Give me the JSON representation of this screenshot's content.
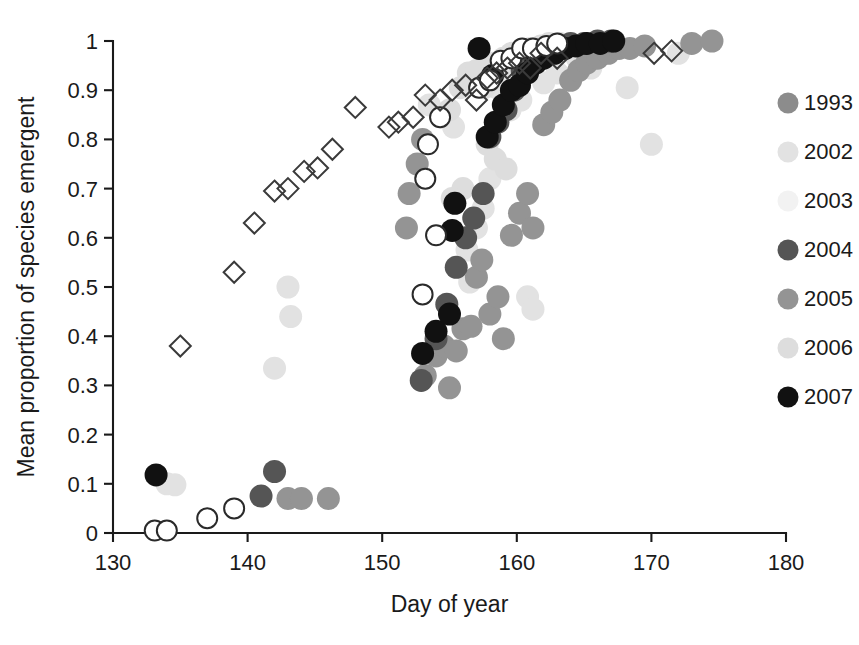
{
  "figure": {
    "type": "scatter-plot",
    "background": "#ffffff"
  },
  "axes": {
    "x_title": "Day of year",
    "y_title": "Mean proportion of species emergent",
    "x_ticks": [
      "130",
      "140",
      "150",
      "160",
      "170",
      "180"
    ],
    "y_ticks": [
      "0",
      "0.1",
      "0.2",
      "0.3",
      "0.4",
      "0.5",
      "0.6",
      "0.7",
      "0.8",
      "0.9",
      "1"
    ]
  },
  "legend": {
    "items": [
      {
        "label": "1993",
        "marker": "circle",
        "color": "#8c8c8c"
      },
      {
        "label": "2002",
        "marker": "circle",
        "color": "#e2e2e2"
      },
      {
        "label": "2003",
        "marker": "circle",
        "color": "#f2f2f2"
      },
      {
        "label": "2004",
        "marker": "circle",
        "color": "#555555"
      },
      {
        "label": "2005",
        "marker": "circle",
        "color": "#949494"
      },
      {
        "label": "2006",
        "marker": "circle",
        "color": "#dddddd"
      },
      {
        "label": "2007",
        "marker": "circle",
        "color": "#111111"
      }
    ]
  },
  "chart_data": {
    "type": "scatter",
    "title": "",
    "xlabel": "Day of year",
    "ylabel": "Mean proportion of species emergent",
    "xlim": [
      130,
      180
    ],
    "ylim": [
      0,
      1
    ],
    "xticks": [
      130,
      140,
      150,
      160,
      170,
      180
    ],
    "yticks": [
      0,
      0.1,
      0.2,
      0.3,
      0.4,
      0.5,
      0.6,
      0.7,
      0.8,
      0.9,
      1.0
    ],
    "grid": false,
    "legend_position": "right",
    "series": [
      {
        "name": "1993",
        "marker": "open-diamond",
        "color": "#3a3a3a",
        "fill": "none",
        "points": [
          [
            135.0,
            0.38
          ],
          [
            139.0,
            0.53
          ],
          [
            140.5,
            0.63
          ],
          [
            142.0,
            0.695
          ],
          [
            143.0,
            0.7
          ],
          [
            144.2,
            0.735
          ],
          [
            145.2,
            0.742
          ],
          [
            146.3,
            0.78
          ],
          [
            148.0,
            0.865
          ],
          [
            150.5,
            0.825
          ],
          [
            151.2,
            0.835
          ],
          [
            152.3,
            0.845
          ],
          [
            153.2,
            0.89
          ],
          [
            154.3,
            0.88
          ],
          [
            155.2,
            0.9
          ],
          [
            156.2,
            0.91
          ],
          [
            157.0,
            0.88
          ],
          [
            157.8,
            0.925
          ],
          [
            158.5,
            0.935
          ],
          [
            159.3,
            0.945
          ],
          [
            160.2,
            0.955
          ],
          [
            161.0,
            0.945
          ],
          [
            161.8,
            0.975
          ],
          [
            163.0,
            0.965
          ],
          [
            170.2,
            0.975
          ],
          [
            171.5,
            0.98
          ]
        ]
      },
      {
        "name": "2002",
        "marker": "circle",
        "color": "#e2e2e2",
        "points": [
          [
            134.0,
            0.1
          ],
          [
            134.6,
            0.098
          ],
          [
            142.0,
            0.335
          ],
          [
            143.2,
            0.44
          ],
          [
            143.0,
            0.5
          ],
          [
            153.5,
            0.87
          ],
          [
            154.5,
            0.845
          ],
          [
            155.3,
            0.825
          ],
          [
            156.3,
            0.575
          ],
          [
            156.5,
            0.51
          ],
          [
            157.0,
            0.62
          ],
          [
            157.5,
            0.66
          ],
          [
            158.0,
            0.72
          ],
          [
            158.5,
            0.905
          ],
          [
            159.0,
            0.93
          ],
          [
            159.5,
            0.86
          ],
          [
            160.3,
            0.88
          ],
          [
            160.8,
            0.48
          ],
          [
            161.2,
            0.455
          ],
          [
            162.0,
            0.915
          ],
          [
            163.0,
            0.935
          ],
          [
            164.5,
            0.965
          ],
          [
            165.5,
            0.945
          ],
          [
            168.2,
            0.905
          ],
          [
            170.0,
            0.79
          ],
          [
            172.0,
            0.975
          ]
        ]
      },
      {
        "name": "2003",
        "marker": "open-circle",
        "color": "#2a2a2a",
        "fill": "#ffffff",
        "points": [
          [
            133.1,
            0.005
          ],
          [
            134.0,
            0.005
          ],
          [
            137.0,
            0.03
          ],
          [
            139.0,
            0.05
          ],
          [
            153.0,
            0.485
          ],
          [
            154.0,
            0.605
          ],
          [
            153.2,
            0.72
          ],
          [
            153.4,
            0.79
          ],
          [
            154.3,
            0.845
          ],
          [
            157.2,
            0.905
          ],
          [
            158.0,
            0.92
          ],
          [
            158.8,
            0.96
          ],
          [
            159.6,
            0.965
          ],
          [
            160.4,
            0.985
          ],
          [
            161.2,
            0.985
          ],
          [
            162.2,
            0.99
          ],
          [
            163.0,
            0.995
          ]
        ]
      },
      {
        "name": "2004",
        "marker": "circle",
        "color": "#555555",
        "points": [
          [
            141.0,
            0.075
          ],
          [
            142.0,
            0.125
          ],
          [
            152.9,
            0.31
          ],
          [
            154.0,
            0.395
          ],
          [
            154.8,
            0.465
          ],
          [
            155.5,
            0.54
          ],
          [
            156.2,
            0.6
          ],
          [
            156.8,
            0.64
          ],
          [
            157.5,
            0.69
          ],
          [
            158.0,
            0.805
          ],
          [
            158.6,
            0.835
          ],
          [
            159.2,
            0.86
          ],
          [
            159.8,
            0.9
          ],
          [
            160.4,
            0.94
          ],
          [
            161.0,
            0.96
          ],
          [
            161.6,
            0.975
          ],
          [
            162.2,
            0.985
          ],
          [
            163.0,
            0.99
          ],
          [
            164.0,
            0.995
          ],
          [
            165.0,
            0.995
          ],
          [
            166.0,
            1.0
          ],
          [
            167.0,
            1.0
          ]
        ]
      },
      {
        "name": "2005",
        "marker": "circle",
        "color": "#949494",
        "points": [
          [
            143.0,
            0.07
          ],
          [
            144.0,
            0.07
          ],
          [
            146.0,
            0.07
          ],
          [
            151.8,
            0.62
          ],
          [
            152.0,
            0.69
          ],
          [
            152.6,
            0.75
          ],
          [
            153.0,
            0.8
          ],
          [
            153.2,
            0.32
          ],
          [
            154.0,
            0.36
          ],
          [
            154.6,
            0.38
          ],
          [
            155.0,
            0.295
          ],
          [
            155.5,
            0.37
          ],
          [
            156.0,
            0.415
          ],
          [
            156.6,
            0.42
          ],
          [
            157.0,
            0.52
          ],
          [
            157.4,
            0.555
          ],
          [
            158.0,
            0.445
          ],
          [
            158.6,
            0.48
          ],
          [
            159.0,
            0.395
          ],
          [
            159.6,
            0.605
          ],
          [
            160.2,
            0.65
          ],
          [
            160.8,
            0.69
          ],
          [
            161.2,
            0.62
          ],
          [
            162.0,
            0.83
          ],
          [
            162.6,
            0.855
          ],
          [
            163.2,
            0.88
          ],
          [
            164.0,
            0.92
          ],
          [
            164.6,
            0.94
          ],
          [
            165.2,
            0.955
          ],
          [
            166.0,
            0.965
          ],
          [
            166.8,
            0.975
          ],
          [
            167.6,
            0.985
          ],
          [
            168.4,
            0.985
          ],
          [
            169.5,
            0.99
          ],
          [
            173.0,
            0.995
          ],
          [
            174.5,
            1.0
          ]
        ]
      },
      {
        "name": "2006",
        "marker": "circle",
        "color": "#dddddd",
        "points": [
          [
            155.0,
            0.86
          ],
          [
            155.8,
            0.905
          ],
          [
            156.4,
            0.935
          ],
          [
            157.0,
            0.94
          ],
          [
            157.6,
            0.905
          ],
          [
            158.2,
            0.955
          ],
          [
            159.0,
            0.965
          ],
          [
            159.6,
            0.975
          ],
          [
            160.2,
            0.965
          ],
          [
            161.0,
            0.985
          ],
          [
            161.8,
            0.99
          ],
          [
            162.4,
            0.995
          ],
          [
            163.2,
            0.995
          ],
          [
            164.0,
            0.99
          ],
          [
            157.8,
            0.79
          ],
          [
            158.4,
            0.76
          ],
          [
            159.2,
            0.74
          ],
          [
            156.0,
            0.7
          ],
          [
            155.2,
            0.68
          ]
        ]
      },
      {
        "name": "2007",
        "marker": "circle",
        "color": "#111111",
        "points": [
          [
            133.2,
            0.118
          ],
          [
            153.0,
            0.365
          ],
          [
            154.0,
            0.41
          ],
          [
            155.0,
            0.445
          ],
          [
            155.2,
            0.615
          ],
          [
            155.4,
            0.67
          ],
          [
            157.8,
            0.805
          ],
          [
            158.4,
            0.835
          ],
          [
            159.0,
            0.87
          ],
          [
            159.6,
            0.9
          ],
          [
            160.2,
            0.91
          ],
          [
            160.8,
            0.935
          ],
          [
            161.4,
            0.955
          ],
          [
            162.0,
            0.965
          ],
          [
            162.8,
            0.975
          ],
          [
            163.6,
            0.985
          ],
          [
            164.4,
            0.99
          ],
          [
            165.2,
            0.995
          ],
          [
            166.2,
            0.995
          ],
          [
            167.2,
            1.0
          ],
          [
            158.2,
            0.93
          ],
          [
            157.2,
            0.985
          ]
        ]
      }
    ]
  }
}
